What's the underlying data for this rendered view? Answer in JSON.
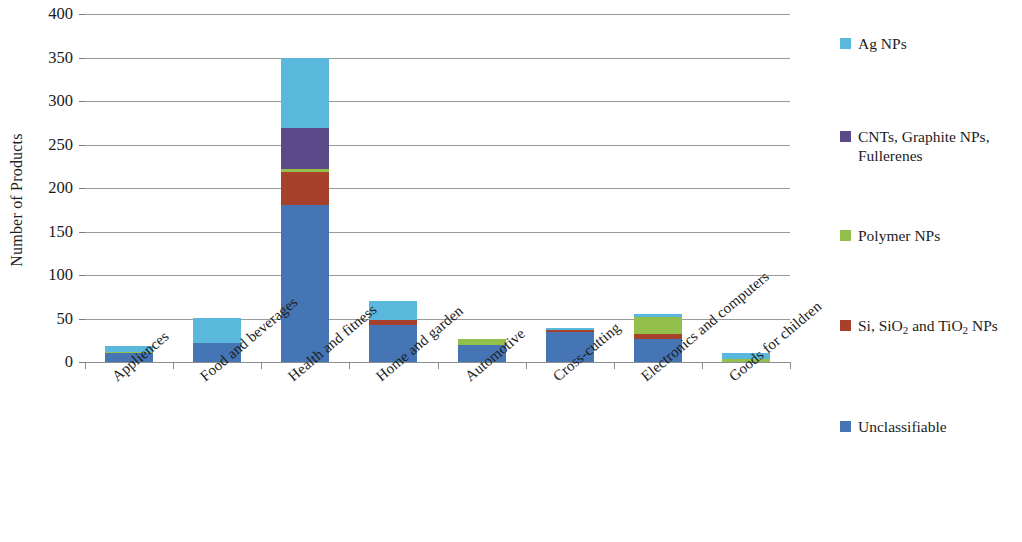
{
  "chart_data": {
    "type": "bar",
    "stacked": true,
    "title": "",
    "xlabel": "",
    "ylabel": "Number of Products",
    "ylim": [
      0,
      400
    ],
    "ytick_step": 50,
    "yticks": [
      "400",
      "350",
      "300",
      "250",
      "200",
      "150",
      "100",
      "50",
      "0"
    ],
    "grid": true,
    "legend_position": "right",
    "categories": [
      "Appliences",
      "Food and beverages",
      "Health and fitness",
      "Home and garden",
      "Automotive",
      "Cross-cutting",
      "Electronics and computers",
      "Goods for children"
    ],
    "series": [
      {
        "name": "Unclassifiable",
        "color": "#4575b4",
        "values": [
          10,
          22,
          181,
          42,
          19,
          34,
          26,
          0
        ]
      },
      {
        "name": "Si, SiO2 and TiO2 NPs",
        "color": "#a8412c",
        "values": [
          0,
          0,
          37,
          6,
          0,
          3,
          6,
          0
        ]
      },
      {
        "name": "Polymer NPs",
        "color": "#93c04a",
        "values": [
          2,
          0,
          4,
          0,
          8,
          0,
          20,
          3
        ]
      },
      {
        "name": "CNTs, Graphite NPs, Fullerenes",
        "color": "#5a4a8a",
        "values": [
          0,
          0,
          47,
          0,
          0,
          0,
          0,
          0
        ]
      },
      {
        "name": "Ag NPs",
        "color": "#5bb8dd",
        "values": [
          7,
          29,
          80,
          22,
          0,
          2,
          3,
          7
        ]
      }
    ],
    "totals": [
      19,
      51,
      349,
      70,
      27,
      39,
      55,
      10
    ]
  },
  "legend": {
    "items": [
      {
        "label": "Ag NPs",
        "color": "#5bb8dd"
      },
      {
        "label": "CNTs, Graphite NPs,\nFullerenes",
        "color": "#5a4a8a"
      },
      {
        "label": "Polymer NPs",
        "color": "#93c04a"
      },
      {
        "label": "Si, SiO2 and TiO2 NPs",
        "color": "#a8412c"
      },
      {
        "label": "Unclassifiable",
        "color": "#4575b4"
      }
    ]
  }
}
